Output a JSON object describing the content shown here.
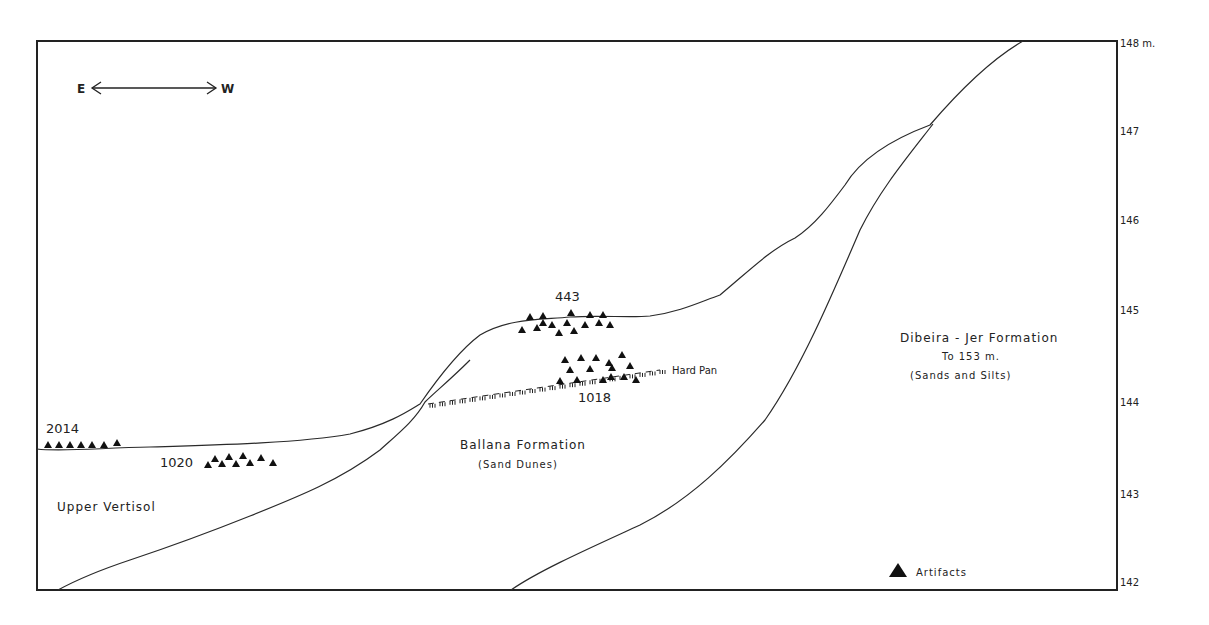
{
  "orientation": {
    "left": "E",
    "right": "W"
  },
  "axis": {
    "unit_label": "148 m.",
    "ticks": [
      {
        "label": "148 m.",
        "value": 148
      },
      {
        "label": "147",
        "value": 147
      },
      {
        "label": "146",
        "value": 146
      },
      {
        "label": "145",
        "value": 145
      },
      {
        "label": "144",
        "value": 144
      },
      {
        "label": "143",
        "value": 143
      },
      {
        "label": "142",
        "value": 142
      }
    ]
  },
  "formations": {
    "upper_vertisol": "Upper Vertisol",
    "ballana": {
      "name": "Ballana Formation",
      "sub": "(Sand Dunes)"
    },
    "dibeira_jer": {
      "name": "Dibeira - Jer Formation",
      "depth": "To 153 m.",
      "sub": "(Sands and Silts)"
    }
  },
  "features": {
    "hard_pan": "Hard Pan"
  },
  "sites": [
    {
      "id": "2014",
      "label": "2014"
    },
    {
      "id": "1020",
      "label": "1020"
    },
    {
      "id": "443",
      "label": "443"
    },
    {
      "id": "1018",
      "label": "1018"
    }
  ],
  "legend": {
    "artifacts": "Artifacts"
  },
  "colors": {
    "line": "#2a2a2a",
    "background": "#ffffff"
  }
}
